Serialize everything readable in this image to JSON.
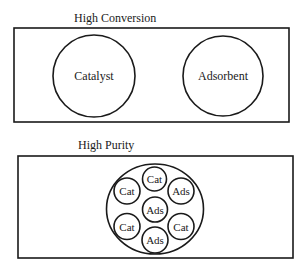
{
  "panels": {
    "top": {
      "title": "High Conversion",
      "particles": [
        {
          "label": "Catalyst"
        },
        {
          "label": "Adsorbent"
        }
      ]
    },
    "bottom": {
      "title": "High Purity",
      "pellet_particles": [
        {
          "label": "Cat",
          "position": "top"
        },
        {
          "label": "Cat",
          "position": "upper-left"
        },
        {
          "label": "Ads",
          "position": "upper-right"
        },
        {
          "label": "Ads",
          "position": "center"
        },
        {
          "label": "Cat",
          "position": "lower-left"
        },
        {
          "label": "Cat",
          "position": "lower-right"
        },
        {
          "label": "Ads",
          "position": "bottom"
        }
      ]
    }
  },
  "colors": {
    "stroke": "#1a1a1a",
    "background": "#ffffff"
  }
}
